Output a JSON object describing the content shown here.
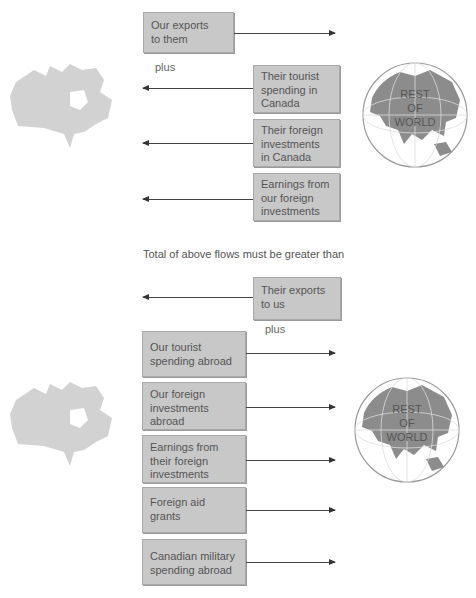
{
  "diagram": {
    "globe_label": [
      "REST",
      "OF",
      "WORLD"
    ],
    "top_section": {
      "boxes": [
        {
          "text": "Our exports to them",
          "lines": [
            "Our exports",
            "to them"
          ],
          "arrow_direction": "right"
        },
        {
          "text": "Their tourist spending in Canada",
          "lines": [
            "Their tourist",
            "spending in",
            "Canada"
          ],
          "arrow_direction": "left"
        },
        {
          "text": "Their foreign investments in Canada",
          "lines": [
            "Their foreign",
            "investments",
            "in Canada"
          ],
          "arrow_direction": "left"
        },
        {
          "text": "Earnings from our foreign investments",
          "lines": [
            "Earnings from",
            "our foreign",
            "investments"
          ],
          "arrow_direction": "left"
        }
      ],
      "plus_label": "plus"
    },
    "comparison_text": "Total of above flows must be greater than",
    "bottom_section": {
      "boxes": [
        {
          "text": "Their exports to us",
          "lines": [
            "Their exports",
            "to us"
          ],
          "arrow_direction": "left"
        },
        {
          "text": "Our tourist spending abroad",
          "lines": [
            "Our tourist",
            "spending abroad"
          ],
          "arrow_direction": "right"
        },
        {
          "text": "Our foreign investments abroad",
          "lines": [
            "Our foreign",
            "investments",
            "abroad"
          ],
          "arrow_direction": "right"
        },
        {
          "text": "Earnings from their foreign investments",
          "lines": [
            "Earnings from",
            "their foreign",
            "investments"
          ],
          "arrow_direction": "right"
        },
        {
          "text": "Foreign aid grants",
          "lines": [
            "Foreign aid",
            "grants"
          ],
          "arrow_direction": "right"
        },
        {
          "text": "Canadian military spending abroad",
          "lines": [
            "Canadian military",
            "spending abroad"
          ],
          "arrow_direction": "right"
        }
      ],
      "plus_label": "plus"
    },
    "colors": {
      "box_fill": "#c8c8c8",
      "box_border": "#a9a9a9",
      "map_gray": "#cfcfcf",
      "globe_land": "#8c8c8c",
      "arrow": "#444444"
    }
  }
}
